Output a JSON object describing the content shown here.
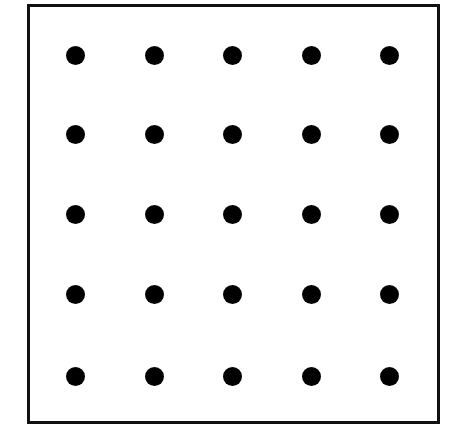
{
  "diagram": {
    "type": "dot-grid",
    "rows": 5,
    "cols": 5,
    "dot_color": "#000000",
    "border_color": "#111111",
    "background": "#ffffff",
    "col_centers": [
      75,
      154,
      232,
      311,
      389
    ],
    "row_centers": [
      55,
      134,
      214,
      294,
      376
    ],
    "dot_count": 25
  }
}
